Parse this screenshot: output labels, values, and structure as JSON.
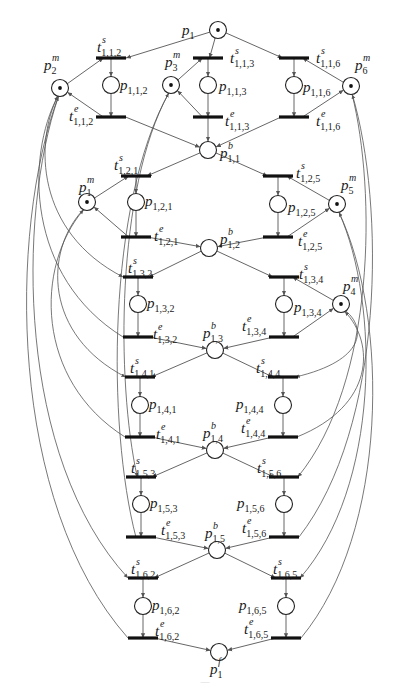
{
  "figure": {
    "type": "petri-net",
    "caption_visible": "faint, illegible caption at bottom",
    "colors": {
      "stroke": "#222222",
      "arc": "#555555",
      "transition": "#111111",
      "background": "#ffffff"
    }
  },
  "places": [
    {
      "id": "p1",
      "base": "p",
      "sub": "1",
      "sup": "",
      "x": 218,
      "y": 30,
      "token": true,
      "label_dx": -36,
      "label_dy": 5
    },
    {
      "id": "p2m",
      "base": "p",
      "sub": "2",
      "sup": "m",
      "x": 60,
      "y": 88,
      "token": true,
      "label_dx": -16,
      "label_dy": -18
    },
    {
      "id": "p3m",
      "base": "p",
      "sub": "3",
      "sup": "m",
      "x": 171,
      "y": 85,
      "token": true,
      "label_dx": -6,
      "label_dy": -18
    },
    {
      "id": "p6m",
      "base": "p",
      "sub": "6",
      "sup": "m",
      "x": 351,
      "y": 86,
      "token": true,
      "label_dx": 4,
      "label_dy": -16
    },
    {
      "id": "p112",
      "base": "p",
      "sub": "1,1,2",
      "sup": "",
      "x": 111,
      "y": 85,
      "token": false,
      "label_dx": 9,
      "label_dy": 5
    },
    {
      "id": "p113",
      "base": "p",
      "sub": "1,1,3",
      "sup": "",
      "x": 208,
      "y": 85,
      "token": false,
      "label_dx": 11,
      "label_dy": 6
    },
    {
      "id": "p116",
      "base": "p",
      "sub": "1,1,6",
      "sup": "",
      "x": 294,
      "y": 85,
      "token": false,
      "label_dx": 9,
      "label_dy": 7
    },
    {
      "id": "p11b",
      "base": "p",
      "sub": "1,1",
      "sup": "b",
      "x": 208,
      "y": 150,
      "token": false,
      "label_dx": 12,
      "label_dy": 8
    },
    {
      "id": "p1m",
      "base": "p",
      "sub": "1",
      "sup": "m",
      "x": 87,
      "y": 202,
      "token": true,
      "label_dx": -8,
      "label_dy": -10
    },
    {
      "id": "p121",
      "base": "p",
      "sub": "1,2,1",
      "sup": "",
      "x": 136,
      "y": 202,
      "token": false,
      "label_dx": 9,
      "label_dy": 4
    },
    {
      "id": "p125",
      "base": "p",
      "sub": "1,2,5",
      "sup": "",
      "x": 278,
      "y": 204,
      "token": false,
      "label_dx": 10,
      "label_dy": 8
    },
    {
      "id": "p5m",
      "base": "p",
      "sub": "5",
      "sup": "m",
      "x": 337,
      "y": 204,
      "token": true,
      "label_dx": 4,
      "label_dy": -14
    },
    {
      "id": "p12b",
      "base": "p",
      "sub": "1,2",
      "sup": "b",
      "x": 209,
      "y": 248,
      "token": false,
      "label_dx": 11,
      "label_dy": -4
    },
    {
      "id": "p132",
      "base": "p",
      "sub": "1,3,2",
      "sup": "",
      "x": 138,
      "y": 304,
      "token": false,
      "label_dx": 9,
      "label_dy": 4
    },
    {
      "id": "p134",
      "base": "p",
      "sub": "1,3,4",
      "sup": "",
      "x": 284,
      "y": 304,
      "token": false,
      "label_dx": 10,
      "label_dy": 8
    },
    {
      "id": "p4m",
      "base": "p",
      "sub": "4",
      "sup": "m",
      "x": 341,
      "y": 304,
      "token": true,
      "label_dx": 2,
      "label_dy": -13
    },
    {
      "id": "p13b",
      "base": "p",
      "sub": "1,3",
      "sup": "b",
      "x": 215,
      "y": 350,
      "token": false,
      "label_dx": -12,
      "label_dy": -12
    },
    {
      "id": "p141",
      "base": "p",
      "sub": "1,4,1",
      "sup": "",
      "x": 140,
      "y": 405,
      "token": false,
      "label_dx": 9,
      "label_dy": 4
    },
    {
      "id": "p144",
      "base": "p",
      "sub": "1,4,4",
      "sup": "",
      "x": 283,
      "y": 405,
      "token": false,
      "label_dx": -47,
      "label_dy": 4
    },
    {
      "id": "p14b",
      "base": "p",
      "sub": "1,4",
      "sup": "b",
      "x": 215,
      "y": 450,
      "token": false,
      "label_dx": -12,
      "label_dy": -12
    },
    {
      "id": "p153",
      "base": "p",
      "sub": "1,5,3",
      "sup": "",
      "x": 141,
      "y": 504,
      "token": false,
      "label_dx": 9,
      "label_dy": 4
    },
    {
      "id": "p156",
      "base": "p",
      "sub": "1,5,6",
      "sup": "",
      "x": 284,
      "y": 504,
      "token": false,
      "label_dx": -47,
      "label_dy": 4
    },
    {
      "id": "p15b",
      "base": "p",
      "sub": "1,5",
      "sup": "b",
      "x": 217,
      "y": 550,
      "token": false,
      "label_dx": -12,
      "label_dy": -12
    },
    {
      "id": "p162",
      "base": "p",
      "sub": "1,6,2",
      "sup": "",
      "x": 143,
      "y": 606,
      "token": false,
      "label_dx": 9,
      "label_dy": 4
    },
    {
      "id": "p165",
      "base": "p",
      "sub": "1,6,5",
      "sup": "",
      "x": 286,
      "y": 606,
      "token": false,
      "label_dx": -47,
      "label_dy": 4
    },
    {
      "id": "p1f",
      "base": "p",
      "sub": "1",
      "sup": "f",
      "x": 219,
      "y": 652,
      "token": false,
      "label_dx": -9,
      "label_dy": 22
    }
  ],
  "transitions": [
    {
      "id": "t112s",
      "sub": "1,1,2",
      "sup": "s",
      "x": 111,
      "y": 58,
      "label_dx": -14,
      "label_dy": -6
    },
    {
      "id": "t113s",
      "sub": "1,1,3",
      "sup": "s",
      "x": 208,
      "y": 58,
      "label_dx": 22,
      "label_dy": 5
    },
    {
      "id": "t116s",
      "sub": "1,1,6",
      "sup": "s",
      "x": 294,
      "y": 58,
      "label_dx": 22,
      "label_dy": 5
    },
    {
      "id": "t112e",
      "sub": "1,1,2",
      "sup": "e",
      "x": 111,
      "y": 117,
      "label_dx": -42,
      "label_dy": 4
    },
    {
      "id": "t113e",
      "sub": "1,1,3",
      "sup": "e",
      "x": 208,
      "y": 117,
      "label_dx": 17,
      "label_dy": 9
    },
    {
      "id": "t116e",
      "sub": "1,1,6",
      "sup": "e",
      "x": 294,
      "y": 117,
      "label_dx": 22,
      "label_dy": 9
    },
    {
      "id": "t121s",
      "sub": "1,2,1",
      "sup": "s",
      "x": 136,
      "y": 176,
      "label_dx": -22,
      "label_dy": -6
    },
    {
      "id": "t125s",
      "sub": "1,2,5",
      "sup": "s",
      "x": 278,
      "y": 176,
      "label_dx": 18,
      "label_dy": 2
    },
    {
      "id": "t121e",
      "sub": "1,2,1",
      "sup": "e",
      "x": 136,
      "y": 237,
      "label_dx": 18,
      "label_dy": 4
    },
    {
      "id": "t125e",
      "sub": "1,2,5",
      "sup": "e",
      "x": 278,
      "y": 237,
      "label_dx": 20,
      "label_dy": 9
    },
    {
      "id": "t132s",
      "sub": "1,3,2",
      "sup": "s",
      "x": 138,
      "y": 277,
      "label_dx": -10,
      "label_dy": -4
    },
    {
      "id": "t134s",
      "sub": "1,3,4",
      "sup": "s",
      "x": 284,
      "y": 277,
      "label_dx": 15,
      "label_dy": 2
    },
    {
      "id": "t132e",
      "sub": "1,3,2",
      "sup": "e",
      "x": 138,
      "y": 337,
      "label_dx": 15,
      "label_dy": 2
    },
    {
      "id": "t134e",
      "sub": "1,3,4",
      "sup": "e",
      "x": 284,
      "y": 337,
      "label_dx": -42,
      "label_dy": -6
    },
    {
      "id": "t141s",
      "sub": "1,4,1",
      "sup": "s",
      "x": 140,
      "y": 377,
      "label_dx": -10,
      "label_dy": -4
    },
    {
      "id": "t144s",
      "sub": "1,4,4",
      "sup": "s",
      "x": 283,
      "y": 377,
      "label_dx": -27,
      "label_dy": -4
    },
    {
      "id": "t141e",
      "sub": "1,4,1",
      "sup": "e",
      "x": 140,
      "y": 437,
      "label_dx": 16,
      "label_dy": 2
    },
    {
      "id": "t144e",
      "sub": "1,4,4",
      "sup": "e",
      "x": 283,
      "y": 437,
      "label_dx": -42,
      "label_dy": -4
    },
    {
      "id": "t153s",
      "sub": "1,5,3",
      "sup": "s",
      "x": 141,
      "y": 477,
      "label_dx": -10,
      "label_dy": -4
    },
    {
      "id": "t156s",
      "sub": "1,5,6",
      "sup": "s",
      "x": 284,
      "y": 477,
      "label_dx": -27,
      "label_dy": -4
    },
    {
      "id": "t153e",
      "sub": "1,5,3",
      "sup": "e",
      "x": 141,
      "y": 537,
      "label_dx": 20,
      "label_dy": -2
    },
    {
      "id": "t156e",
      "sub": "1,5,6",
      "sup": "e",
      "x": 284,
      "y": 537,
      "label_dx": -42,
      "label_dy": -4
    },
    {
      "id": "t162s",
      "sub": "1,6,2",
      "sup": "s",
      "x": 143,
      "y": 578,
      "label_dx": -12,
      "label_dy": -4
    },
    {
      "id": "t165s",
      "sub": "1,6,5",
      "sup": "s",
      "x": 286,
      "y": 578,
      "label_dx": -13,
      "label_dy": -4
    },
    {
      "id": "t162e",
      "sub": "1,6,2",
      "sup": "e",
      "x": 143,
      "y": 638,
      "label_dx": 12,
      "label_dy": -2
    },
    {
      "id": "t165e",
      "sub": "1,6,5",
      "sup": "e",
      "x": 286,
      "y": 638,
      "label_dx": -42,
      "label_dy": -4
    }
  ],
  "arcs": [
    [
      "p1",
      "t112s"
    ],
    [
      "p1",
      "t113s"
    ],
    [
      "p1",
      "t116s"
    ],
    [
      "p2m",
      "t112s"
    ],
    [
      "p3m",
      "t113s"
    ],
    [
      "p6m",
      "t116s"
    ],
    [
      "t112s",
      "p112"
    ],
    [
      "t113s",
      "p113"
    ],
    [
      "t116s",
      "p116"
    ],
    [
      "p112",
      "t112e"
    ],
    [
      "p113",
      "t113e"
    ],
    [
      "p116",
      "t116e"
    ],
    [
      "t112e",
      "p2m"
    ],
    [
      "t113e",
      "p3m"
    ],
    [
      "t116e",
      "p6m"
    ],
    [
      "t112e",
      "p11b"
    ],
    [
      "t113e",
      "p11b"
    ],
    [
      "t116e",
      "p11b"
    ],
    [
      "p11b",
      "t121s"
    ],
    [
      "p11b",
      "t125s"
    ],
    [
      "p1m",
      "t121s"
    ],
    [
      "p5m",
      "t125s"
    ],
    [
      "t121s",
      "p121"
    ],
    [
      "t125s",
      "p125"
    ],
    [
      "p121",
      "t121e"
    ],
    [
      "p125",
      "t125e"
    ],
    [
      "t121e",
      "p1m"
    ],
    [
      "t125e",
      "p5m"
    ],
    [
      "t121e",
      "p12b"
    ],
    [
      "t125e",
      "p12b"
    ],
    [
      "p12b",
      "t132s"
    ],
    [
      "p12b",
      "t134s"
    ],
    [
      "p4m",
      "t134s"
    ],
    [
      "t132s",
      "p132"
    ],
    [
      "t134s",
      "p134"
    ],
    [
      "p132",
      "t132e"
    ],
    [
      "p134",
      "t134e"
    ],
    [
      "t134e",
      "p4m"
    ],
    [
      "t132e",
      "p13b"
    ],
    [
      "t134e",
      "p13b"
    ],
    [
      "p13b",
      "t141s"
    ],
    [
      "p13b",
      "t144s"
    ],
    [
      "t141s",
      "p141"
    ],
    [
      "t144s",
      "p144"
    ],
    [
      "p141",
      "t141e"
    ],
    [
      "p144",
      "t144e"
    ],
    [
      "t141e",
      "p14b"
    ],
    [
      "t144e",
      "p14b"
    ],
    [
      "p14b",
      "t153s"
    ],
    [
      "p14b",
      "t156s"
    ],
    [
      "t153s",
      "p153"
    ],
    [
      "t156s",
      "p156"
    ],
    [
      "p153",
      "t153e"
    ],
    [
      "p156",
      "t156e"
    ],
    [
      "t153e",
      "p15b"
    ],
    [
      "t156e",
      "p15b"
    ],
    [
      "p15b",
      "t162s"
    ],
    [
      "p15b",
      "t165s"
    ],
    [
      "t162s",
      "p162"
    ],
    [
      "t165s",
      "p165"
    ],
    [
      "p162",
      "t162e"
    ],
    [
      "p165",
      "t165e"
    ],
    [
      "t162e",
      "p1f"
    ],
    [
      "t165e",
      "p1f"
    ]
  ],
  "resource_curves": [
    {
      "from": "p2m",
      "to": "t132s",
      "note": "resource p2 to start of op 1,3,2"
    },
    {
      "from": "t132e",
      "to": "p2m",
      "note": "release p2"
    },
    {
      "from": "p2m",
      "to": "t162s",
      "note": "resource p2 to start of op 1,6,2"
    },
    {
      "from": "t162e",
      "to": "p2m",
      "note": "release p2"
    },
    {
      "from": "p3m",
      "to": "t153s",
      "note": "resource p3 to start of op 1,5,3"
    },
    {
      "from": "t153e",
      "to": "p3m",
      "note": "release p3"
    },
    {
      "from": "p1m",
      "to": "t141s",
      "note": "resource p1 to start of op 1,4,1"
    },
    {
      "from": "t141e",
      "to": "p1m",
      "note": "release p1"
    },
    {
      "from": "p4m",
      "to": "t144s",
      "note": "resource p4 to start of op 1,4,4"
    },
    {
      "from": "t144e",
      "to": "p4m",
      "note": "release p4"
    },
    {
      "from": "p5m",
      "to": "t165s",
      "note": "resource p5 to start of op 1,6,5"
    },
    {
      "from": "t165e",
      "to": "p5m",
      "note": "release p5"
    },
    {
      "from": "p6m",
      "to": "t156s",
      "note": "resource p6 to start of op 1,5,6"
    },
    {
      "from": "t156e",
      "to": "p6m",
      "note": "release p6"
    }
  ]
}
